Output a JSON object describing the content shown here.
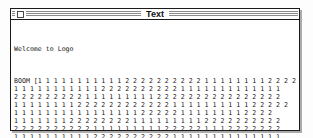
{
  "window": {
    "title": "Text"
  },
  "icons": {
    "close_box": "close-box-icon"
  },
  "colors": {
    "stripe": "#8a8a8a",
    "shadow": "#ababab",
    "border": "#1a1a1a",
    "text": "#161616"
  },
  "content": {
    "welcome": "Welcome to Logo",
    "lines": [
      "BOOM [1 1 1 1 1 1 1 1 1 1 1 2 2 2 2 2 2 2 2 2 2 1 1 1 1 1 1 1 1 2 2 2 2",
      "1 1 1 1 1 1 1 1 1 1 1 2 2 2 2 2 2 2 2 2 2 1 1 1 1 1 1 1 1 1 1 1 1 1",
      "2 2 2 2 2 2 2 2 2 1 1 1 1 1 1 1 1 1 2 2 2 2 2 2 2 2 2 2 2 2 2 2 2 2",
      "1 1 1 1 1 1 1 1 2 2 2 2 2 2 2 2 2 2 2 2 1 1 1 1 1 1 1 1 1 1 2 2 2 2 2",
      "1 1 1 1 1 1 1 1 1 1 1 1 1 1 1 1 2 2 2 2 2 1 1 1 1 1 1 1 1 2 2 2 2",
      "1 1 1 1 1 1 1 2 2 2 2 2 2 2 2 1 1 1 1 1 1 1 1 1 2 2 2 2 2 2 2 2 2 2",
      "2 2 2 2 2 2 2 2 2 2 1 1 1 1 1 1 1 1 1 2 2 2 2 2 1 1 1 2 2 2 2 2 2 2",
      "1 1 1 1 1 1 1 1 1 1 2 2 2 2 2 2 2 2 2 2 1 1 1 1 1 1 1 1 1 1 1 1 1 1",
      "2 2 2 2 2 2 2 2 2 1 1 1 1 1 1 1 1 1 1 2 2 2 2 2 2 2 2 2 2 2 2 2 2 2"
    ]
  }
}
